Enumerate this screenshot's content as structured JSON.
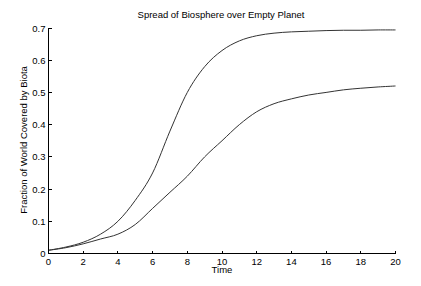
{
  "chart_data": {
    "type": "line",
    "title": "Spread of Biosphere over Empty Planet",
    "xlabel": "Time",
    "ylabel": "Fraction of World Covered by Biota",
    "xlim": [
      0,
      20
    ],
    "ylim": [
      0,
      0.7
    ],
    "xticks": [
      0,
      2,
      4,
      6,
      8,
      10,
      12,
      14,
      16,
      18,
      20
    ],
    "xtick_labels": [
      "0",
      "2",
      "4",
      "6",
      "8",
      "10",
      "12",
      "14",
      "16",
      "18",
      "20"
    ],
    "yticks": [
      0,
      0.1,
      0.2,
      0.3,
      0.4,
      0.5,
      0.6,
      0.7
    ],
    "ytick_labels": [
      "0",
      "0.1",
      "0.2",
      "0.3",
      "0.4",
      "0.5",
      "0.6",
      "0.7"
    ],
    "grid": false,
    "legend": null,
    "x": [
      0,
      1,
      2,
      3,
      4,
      5,
      6,
      7,
      8,
      9,
      10,
      11,
      12,
      13,
      14,
      15,
      16,
      17,
      18,
      19,
      20
    ],
    "series": [
      {
        "name": "upper curve",
        "values": [
          0.01,
          0.02,
          0.035,
          0.06,
          0.1,
          0.165,
          0.25,
          0.38,
          0.5,
          0.58,
          0.63,
          0.66,
          0.676,
          0.684,
          0.688,
          0.69,
          0.692,
          0.693,
          0.693,
          0.694,
          0.694
        ],
        "color": "#333333"
      },
      {
        "name": "lower curve",
        "values": [
          0.01,
          0.018,
          0.03,
          0.045,
          0.06,
          0.09,
          0.14,
          0.19,
          0.24,
          0.3,
          0.35,
          0.4,
          0.44,
          0.465,
          0.48,
          0.492,
          0.5,
          0.508,
          0.513,
          0.517,
          0.52
        ],
        "color": "#333333"
      }
    ]
  }
}
